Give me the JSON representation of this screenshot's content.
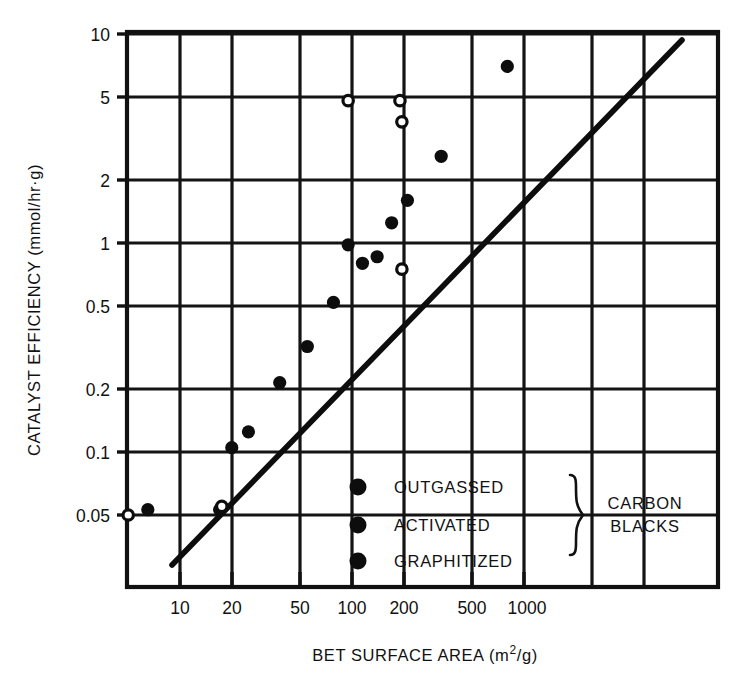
{
  "chart_data": {
    "type": "scatter",
    "title": "",
    "xlabel": "BET SURFACE AREA (m2/g)",
    "xlabel_prefix": "BET SURFACE AREA (m",
    "xlabel_superscript": "2",
    "xlabel_suffix": "/g)",
    "ylabel": "CATALYST EFFICIENCY (mmol/hr·g)",
    "xscale": "log",
    "yscale": "log",
    "xlim": [
      3.0,
      2000
    ],
    "ylim": [
      0.03,
      14
    ],
    "grid": true,
    "legend_position": "inside-lower-right",
    "xticks": [
      10,
      20,
      50,
      100,
      200,
      500,
      1000
    ],
    "xtick_labels": [
      "10",
      "20",
      "50",
      "100",
      "200",
      "500",
      "1000"
    ],
    "yticks": [
      0.05,
      0.1,
      0.2,
      0.5,
      1,
      2,
      5,
      10
    ],
    "ytick_labels": [
      "0.05",
      "0.1",
      "0.2",
      "0.5",
      "1",
      "2",
      "5",
      "10"
    ],
    "x_gridlines": [
      10,
      20,
      50,
      100,
      200,
      500,
      1000
    ],
    "y_gridlines": [
      0.05,
      0.1,
      0.2,
      0.5,
      1,
      2,
      5,
      10
    ],
    "trend_line": {
      "x_start": 4.0,
      "y_start": 0.035,
      "x_end": 1450,
      "y_end": 11.5,
      "label": "correlation line"
    },
    "series": [
      {
        "name": "OUTGASSED",
        "marker": "filled-circle",
        "points": [
          {
            "x": 6.5,
            "y": 0.053
          },
          {
            "x": 17,
            "y": 0.053
          },
          {
            "x": 20,
            "y": 0.105
          },
          {
            "x": 25,
            "y": 0.125
          },
          {
            "x": 38,
            "y": 0.215
          },
          {
            "x": 55,
            "y": 0.32
          },
          {
            "x": 78,
            "y": 0.52
          },
          {
            "x": 95,
            "y": 0.98
          },
          {
            "x": 115,
            "y": 0.8
          },
          {
            "x": 140,
            "y": 0.86
          },
          {
            "x": 170,
            "y": 1.25
          },
          {
            "x": 210,
            "y": 1.6
          },
          {
            "x": 330,
            "y": 2.6
          },
          {
            "x": 800,
            "y": 7.0
          }
        ]
      },
      {
        "name": "ACTIVATED",
        "marker": "open-circle",
        "points": [
          {
            "x": 5.0,
            "y": 0.05
          },
          {
            "x": 17.5,
            "y": 0.055
          },
          {
            "x": 95,
            "y": 4.8
          },
          {
            "x": 190,
            "y": 4.8
          },
          {
            "x": 195,
            "y": 3.8
          },
          {
            "x": 195,
            "y": 0.75
          }
        ]
      },
      {
        "name": "GRAPHITIZED",
        "marker": "filled-circle",
        "points": []
      }
    ],
    "annotations": []
  },
  "legend": {
    "entries": [
      {
        "label": "OUTGASSED",
        "marker": "filled-circle"
      },
      {
        "label": "ACTIVATED",
        "marker": "filled-circle"
      },
      {
        "label": "GRAPHITIZED",
        "marker": "filled-circle"
      }
    ],
    "group_brace_label_line1": "CARBON",
    "group_brace_label_line2": "BLACKS"
  },
  "colors": {
    "ink": "#111111",
    "background": "#ffffff"
  }
}
